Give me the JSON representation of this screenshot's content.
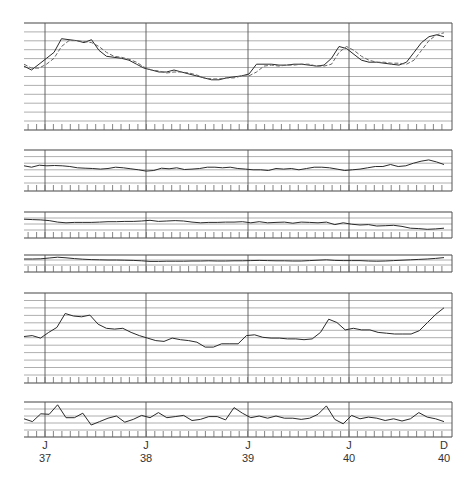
{
  "chart_data": [
    {
      "type": "line",
      "panel": 1,
      "title": "",
      "y_grid_lines": 10,
      "x_months": [
        "O36",
        "N36",
        "D36",
        "J37",
        "F37",
        "M37",
        "A37",
        "M37",
        "J37",
        "J37",
        "A37",
        "S37",
        "O37",
        "N37",
        "D37",
        "J38",
        "F38",
        "M38",
        "A38",
        "M38",
        "J38",
        "J38",
        "A38",
        "S38",
        "O38",
        "N38",
        "D38",
        "J39",
        "F39",
        "M39",
        "A39",
        "M39",
        "J39",
        "J39",
        "A39",
        "S39",
        "O39",
        "N39",
        "D39",
        "J40",
        "F40",
        "M40",
        "A40",
        "M40",
        "J40",
        "J40",
        "A40",
        "S40",
        "O40",
        "N40",
        "D40"
      ],
      "series": [
        {
          "name": "solid",
          "values": [
            56,
            52,
            58,
            64,
            70,
            84,
            83,
            82,
            80,
            83,
            72,
            66,
            65,
            64,
            62,
            58,
            54,
            52,
            50,
            50,
            52,
            50,
            48,
            46,
            44,
            42,
            42,
            44,
            45,
            46,
            48,
            58,
            58,
            58,
            57,
            57,
            58,
            58,
            57,
            56,
            57,
            64,
            76,
            74,
            68,
            62,
            60,
            60,
            59,
            58,
            57,
            60,
            70,
            80,
            86,
            88,
            86
          ]
        },
        {
          "name": "dashed",
          "values": [
            58,
            54,
            54,
            58,
            64,
            76,
            82,
            82,
            81,
            80,
            76,
            70,
            66,
            65,
            63,
            60,
            55,
            52,
            51,
            49,
            50,
            50,
            49,
            47,
            44,
            43,
            43,
            44,
            44,
            46,
            46,
            50,
            56,
            57,
            56,
            57,
            57,
            58,
            58,
            56,
            56,
            58,
            70,
            76,
            72,
            66,
            62,
            60,
            60,
            59,
            59,
            58,
            62,
            72,
            82,
            88,
            90
          ]
        }
      ],
      "ylim": [
        0,
        100
      ]
    },
    {
      "type": "line",
      "panel": 2,
      "y_grid_lines": 4,
      "series": [
        {
          "name": "series",
          "values": [
            52,
            48,
            54,
            52,
            53,
            52,
            50,
            46,
            45,
            44,
            42,
            44,
            48,
            46,
            43,
            40,
            36,
            38,
            45,
            43,
            46,
            41,
            42,
            44,
            48,
            48,
            46,
            48,
            44,
            42,
            40,
            40,
            38,
            44,
            42,
            44,
            40,
            44,
            48,
            48,
            46,
            42,
            38,
            40,
            42,
            46,
            50,
            50,
            56,
            50,
            52,
            60,
            66,
            70,
            64,
            56
          ]
        }
      ],
      "ylim": [
        0,
        100
      ]
    },
    {
      "type": "line",
      "panel": 3,
      "y_grid_lines": 2,
      "series": [
        {
          "name": "series",
          "values": [
            60,
            58,
            56,
            52,
            44,
            40,
            42,
            42,
            42,
            44,
            46,
            46,
            48,
            48,
            50,
            54,
            48,
            50,
            52,
            50,
            44,
            40,
            42,
            42,
            44,
            44,
            46,
            40,
            46,
            40,
            42,
            44,
            38,
            44,
            42,
            40,
            44,
            30,
            40,
            32,
            28,
            30,
            22,
            24,
            26,
            20,
            10,
            8,
            4,
            6,
            10
          ]
        }
      ],
      "ylim": [
        0,
        100
      ]
    },
    {
      "type": "line",
      "panel": 4,
      "y_grid_lines": 1,
      "series": [
        {
          "name": "series",
          "values": [
            60,
            60,
            62,
            70,
            78,
            72,
            64,
            58,
            54,
            52,
            50,
            50,
            48,
            46,
            42,
            36,
            36,
            38,
            38,
            38,
            40,
            40,
            42,
            40,
            40,
            42,
            42,
            44,
            46,
            44,
            42,
            42,
            40,
            40,
            44,
            48,
            52,
            46,
            44,
            44,
            44,
            40,
            38,
            40,
            44,
            48,
            52,
            56,
            60,
            66,
            74
          ]
        }
      ],
      "ylim": [
        0,
        100
      ]
    },
    {
      "type": "line",
      "panel": 5,
      "y_grid_lines": 10,
      "series": [
        {
          "name": "series",
          "values": [
            47,
            48,
            45,
            52,
            58,
            75,
            72,
            71,
            73,
            62,
            57,
            56,
            57,
            52,
            48,
            45,
            42,
            41,
            45,
            43,
            42,
            40,
            34,
            34,
            38,
            38,
            38,
            48,
            49,
            46,
            45,
            45,
            44,
            44,
            43,
            44,
            52,
            68,
            64,
            55,
            57,
            55,
            55,
            52,
            51,
            50,
            50,
            50,
            54,
            64,
            74,
            82
          ]
        }
      ],
      "ylim": [
        0,
        100
      ]
    },
    {
      "type": "line",
      "panel": 6,
      "y_grid_lines": 3,
      "series": [
        {
          "name": "series",
          "values": [
            40,
            30,
            58,
            56,
            90,
            44,
            44,
            60,
            18,
            30,
            42,
            50,
            28,
            38,
            52,
            44,
            62,
            44,
            48,
            52,
            34,
            38,
            48,
            48,
            36,
            80,
            60,
            44,
            50,
            42,
            50,
            42,
            42,
            38,
            42,
            56,
            86,
            38,
            22,
            52,
            40,
            46,
            42,
            34,
            40,
            32,
            40,
            62,
            46,
            40,
            30
          ]
        }
      ],
      "ylim": [
        0,
        100
      ]
    }
  ],
  "axis": {
    "x_labels": [
      {
        "month": "J",
        "year": "37"
      },
      {
        "month": "J",
        "year": "38"
      },
      {
        "month": "J",
        "year": "39"
      },
      {
        "month": "J",
        "year": "40"
      },
      {
        "month": "D",
        "year": "40"
      }
    ]
  }
}
